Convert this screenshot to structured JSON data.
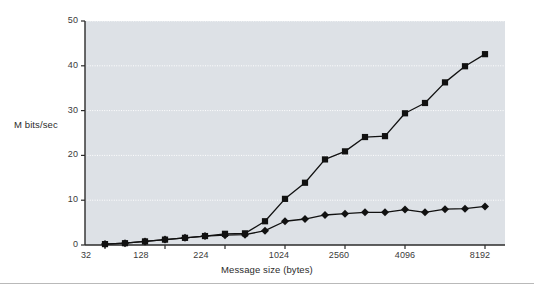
{
  "chart_data": {
    "type": "line",
    "title": "",
    "subtitle": "",
    "xlabel": "Message size (bytes)",
    "ylabel": "M bits/sec",
    "ylim": [
      0,
      50
    ],
    "yticks": [
      0,
      10,
      20,
      30,
      40,
      50
    ],
    "xticks": [
      32,
      128,
      224,
      1024,
      2560,
      4096,
      8192
    ],
    "xtick_labels": [
      "32",
      "128",
      "224",
      "1024",
      "2560",
      "4096",
      "8192"
    ],
    "x_scale": "categorical",
    "grid": "horizontal-dotted",
    "legend": "inline-annotations",
    "annotations": [
      {
        "text": "ATM",
        "series": "ATM"
      },
      {
        "text": "Ethernet",
        "series": "Ethernet"
      }
    ],
    "x_index": [
      0,
      1,
      2,
      3,
      4,
      5,
      6,
      7,
      8,
      9,
      10,
      11,
      12,
      13,
      14,
      15,
      16,
      17,
      18,
      19,
      20,
      21
    ],
    "series": [
      {
        "name": "ATM",
        "marker": "square",
        "color": "#111111",
        "values": [
          0.2,
          0.4,
          0.8,
          1.2,
          1.6,
          2.0,
          2.5,
          2.6,
          5.3,
          10.3,
          13.9,
          19.1,
          20.9,
          24.1,
          24.3,
          29.4,
          31.7,
          36.3,
          39.9,
          42.6
        ]
      },
      {
        "name": "Ethernet",
        "marker": "diamond",
        "color": "#111111",
        "values": [
          0.2,
          0.4,
          0.8,
          1.2,
          1.6,
          2.0,
          2.2,
          2.3,
          3.2,
          5.3,
          5.8,
          6.7,
          7.0,
          7.3,
          7.3,
          7.9,
          7.3,
          8.0,
          8.1,
          8.6
        ]
      }
    ]
  },
  "axes": {
    "y_tick_labels": [
      "50",
      "40",
      "30",
      "20",
      "10",
      "0"
    ],
    "x_tick_labels": [
      "32",
      "128",
      "224",
      "1024",
      "2560",
      "4096",
      "8192"
    ],
    "y_title": "M bits/sec",
    "x_title": "Message size (bytes)"
  },
  "labels": {
    "atm": "ATM",
    "ethernet": "Ethernet"
  },
  "colors": {
    "plot_background": "#dde1e6",
    "gridline": "#ffffff",
    "axis": "#2b2b2b",
    "series": "#111111",
    "page_background": "#ffffff",
    "rule": "#b9b9b9"
  }
}
